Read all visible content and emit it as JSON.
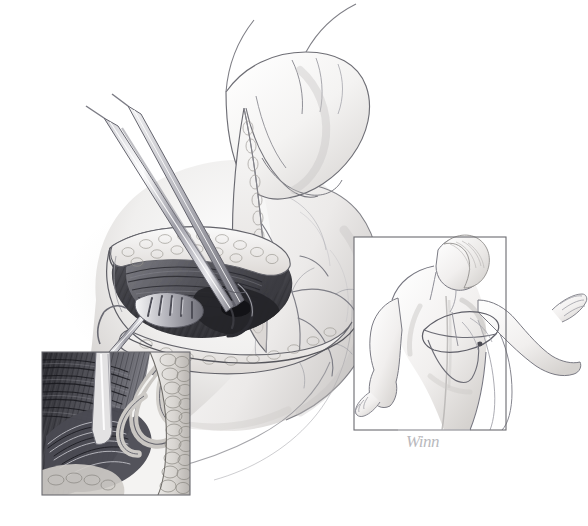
{
  "figure": {
    "kind": "medical-surgical-illustration",
    "medium": "graphite pencil drawing",
    "background_color": "#ffffff",
    "width": 588,
    "height": 526,
    "signature": "Winn",
    "signature_color": "#b9b9bd",
    "line_color": "#5a5a60",
    "frame_color": "#6b6b70"
  },
  "palette": {
    "paper": "#ffffff",
    "skin_light": "#f7f6f5",
    "skin_mid": "#e6e4e2",
    "skin_shadow": "#c9c6c4",
    "muscle_dark": "#3a3a3c",
    "muscle_mid": "#6e6e72",
    "muscle_light": "#a8a8ac",
    "fat_light": "#e2e1e0",
    "steel_light": "#f2f2f3",
    "steel_mid": "#aeaeb4",
    "steel_dark": "#5e5e66",
    "vessel": "#8a8a90",
    "outline": "#55555b"
  },
  "panels": [
    {
      "id": "main-operative-field",
      "name": "Main operative field",
      "framed": false,
      "x": 60,
      "y": 60,
      "width": 400,
      "height": 400,
      "description": "Intraoperative view of a posterior shoulder incision held open with a skin hook and rake retractor while a gloved hand elevates a tissue flap; long dissecting scissors enter the wound."
    },
    {
      "id": "inset-detail-lower-left",
      "name": "Magnified dissection detail",
      "framed": true,
      "x": 42,
      "y": 352,
      "width": 148,
      "height": 143,
      "description": "Close-up of the dissected muscle fibres, the looped neurovascular bundle and the fatty plane at the base of the wound."
    },
    {
      "id": "inset-orientation-right",
      "name": "Patient orientation inset",
      "framed": true,
      "x": 354,
      "y": 237,
      "width": 152,
      "height": 193,
      "description": "Posterior view of a seated patient with the arm abducted forward; an oval marks the planned incision over the scapula."
    }
  ],
  "annotated_structures": [
    {
      "label": "Skin and subcutaneous fat flap",
      "panel": "main-operative-field"
    },
    {
      "label": "Retracted muscle belly",
      "panel": "main-operative-field"
    },
    {
      "label": "Neurovascular pedicle",
      "panel": "main-operative-field"
    },
    {
      "label": "Dissecting scissors",
      "panel": "main-operative-field"
    },
    {
      "label": "Rake retractor",
      "panel": "main-operative-field"
    },
    {
      "label": "Surgeon's hand elevating flap",
      "panel": "main-operative-field"
    },
    {
      "label": "Branching cutaneous vessels",
      "panel": "main-operative-field"
    },
    {
      "label": "Looped vessel and nerve",
      "panel": "inset-detail-lower-left"
    },
    {
      "label": "Fatty areolar plane",
      "panel": "inset-detail-lower-left"
    },
    {
      "label": "Striated muscle fibres",
      "panel": "inset-detail-lower-left"
    },
    {
      "label": "Patient back and scapula",
      "panel": "inset-orientation-right"
    },
    {
      "label": "Planned incision marking",
      "panel": "inset-orientation-right"
    },
    {
      "label": "Abducted arm",
      "panel": "inset-orientation-right"
    }
  ],
  "instruments": [
    {
      "name": "dissecting-scissors",
      "panel": "main-operative-field"
    },
    {
      "name": "rake-retractor",
      "panel": "main-operative-field"
    },
    {
      "name": "skin-hook",
      "panel": "main-operative-field"
    }
  ]
}
